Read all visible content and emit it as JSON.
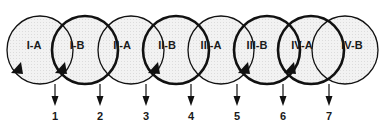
{
  "diagram": {
    "type": "overlapping-ellipse-chain",
    "colors": {
      "background": "#ffffff",
      "ellipse_fill": "#efefef",
      "stroke": "#111111"
    },
    "ellipses": [
      {
        "id": "I-A",
        "label": "I-A",
        "cx": 40,
        "weight": "thin",
        "arrowhead": true,
        "arrow_x": 17,
        "arrow_y": 68
      },
      {
        "id": "I-B",
        "label": "I-B",
        "cx": 85,
        "weight": "thick",
        "arrowhead": true,
        "arrow_x": 61,
        "arrow_y": 68
      },
      {
        "id": "II-A",
        "label": "II-A",
        "cx": 131,
        "weight": "thin",
        "arrowhead": false
      },
      {
        "id": "II-B",
        "label": "II-B",
        "cx": 176,
        "weight": "thick",
        "arrowhead": true,
        "arrow_x": 154,
        "arrow_y": 68
      },
      {
        "id": "III-A",
        "label": "III-A",
        "cx": 221,
        "weight": "thin",
        "arrowhead": false
      },
      {
        "id": "III-B",
        "label": "III-B",
        "cx": 267,
        "weight": "thick",
        "arrowhead": true,
        "arrow_x": 244,
        "arrow_y": 68
      },
      {
        "id": "IV-A",
        "label": "IV-A",
        "cx": 311,
        "weight": "thick",
        "arrowhead": true,
        "arrow_x": 290,
        "arrow_y": 68
      },
      {
        "id": "IV-B",
        "label": "IV-B",
        "cx": 345,
        "weight": "thin",
        "arrowhead": false
      }
    ],
    "labels": [
      {
        "text": "I-A",
        "x": 34
      },
      {
        "text": "I-B",
        "x": 77
      },
      {
        "text": "II-A",
        "x": 122
      },
      {
        "text": "II-B",
        "x": 167
      },
      {
        "text": "III-A",
        "x": 211
      },
      {
        "text": "III-B",
        "x": 257
      },
      {
        "text": "IV-A",
        "x": 302
      },
      {
        "text": "IV-B",
        "x": 352
      }
    ],
    "outputs": [
      {
        "number": "1",
        "x": 55
      },
      {
        "number": "2",
        "x": 100
      },
      {
        "number": "3",
        "x": 146
      },
      {
        "number": "4",
        "x": 191
      },
      {
        "number": "5",
        "x": 237
      },
      {
        "number": "6",
        "x": 283
      },
      {
        "number": "7",
        "x": 329
      }
    ]
  }
}
